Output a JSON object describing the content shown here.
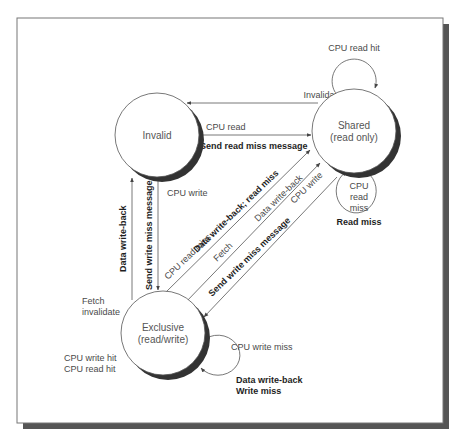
{
  "colors": {
    "background": "#ffffff",
    "frame": "#777777",
    "frame_shadow": "#555555",
    "state_fill": "#ffffff",
    "state_shadow": "#333333",
    "edge": "#555555",
    "text": "#4a4a4a",
    "text_bold": "#1e1e1e"
  },
  "states": {
    "invalid": {
      "line1": "Invalid",
      "line2": ""
    },
    "shared": {
      "line1": "Shared",
      "line2": "(read only)"
    },
    "exclusive": {
      "line1": "Exclusive",
      "line2": "(read/write)"
    }
  },
  "transitions": {
    "shared_to_invalid": {
      "label": "Invalidate"
    },
    "invalid_to_shared": {
      "label": "CPU read",
      "action": "Send read miss message"
    },
    "shared_self_hit": {
      "label": "CPU read hit"
    },
    "shared_self_miss": {
      "label_lines": [
        "CPU",
        "read",
        "miss"
      ],
      "action": "Read miss"
    },
    "invalid_to_exclusive": {
      "label": "CPU write",
      "action": "Send write miss message"
    },
    "exclusive_to_invalid": {
      "label": "Data write-back",
      "trigger": [
        "Fetch",
        "invalidate"
      ]
    },
    "exclusive_to_shared_readmiss": {
      "label": "CPU read miss",
      "action": "Data write-back; read miss"
    },
    "exclusive_to_shared_fetch": {
      "label": "Fetch",
      "action": "Data write-back"
    },
    "shared_to_exclusive": {
      "label": "CPU write",
      "action": "Send write miss message"
    },
    "exclusive_self_hit": {
      "label_lines": [
        "CPU write hit",
        "CPU read hit"
      ]
    },
    "exclusive_self_miss": {
      "label": "CPU write miss",
      "action_lines": [
        "Data write-back",
        "Write miss"
      ]
    }
  }
}
